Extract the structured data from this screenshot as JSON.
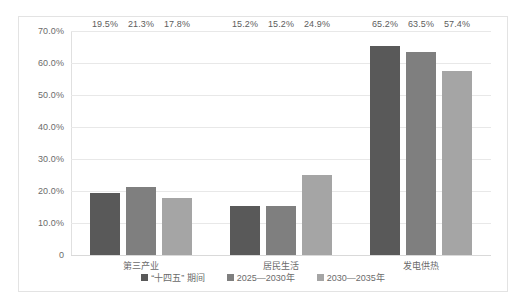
{
  "chart_data": {
    "type": "bar",
    "title": "",
    "subtitle": "",
    "xlabel": "",
    "ylabel": "",
    "ylim": [
      0,
      70
    ],
    "grid": true,
    "legend_position": "bottom",
    "categories": [
      "第三产业",
      "居民生活",
      "发电供热"
    ],
    "ytick_labels": [
      "0",
      "10.0%",
      "20.0%",
      "30.0%",
      "40.0%",
      "50.0%",
      "60.0%",
      "70.0%"
    ],
    "ytick_values": [
      0,
      10,
      20,
      30,
      40,
      50,
      60,
      70
    ],
    "series": [
      {
        "name": "“十四五” 期间",
        "color": "#595959",
        "values": [
          19.5,
          15.2,
          65.2
        ],
        "labels": [
          "19.5%",
          "15.2%",
          "65.2%"
        ]
      },
      {
        "name": "2025—2030年",
        "color": "#7f7f7f",
        "values": [
          21.3,
          15.2,
          63.5
        ],
        "labels": [
          "21.3%",
          "15.2%",
          "63.5%"
        ]
      },
      {
        "name": "2030—2035年",
        "color": "#a5a5a5",
        "values": [
          17.8,
          24.9,
          57.4
        ],
        "labels": [
          "17.8%",
          "24.9%",
          "57.4%"
        ]
      }
    ]
  }
}
